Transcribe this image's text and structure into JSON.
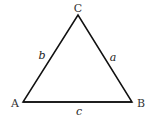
{
  "diagram": {
    "type": "triangle",
    "vertices": {
      "A": "A",
      "B": "B",
      "C": "C"
    },
    "sides": {
      "a": "a",
      "b": "b",
      "c": "c"
    },
    "stroke_color": "#111111",
    "background": "#ffffff"
  }
}
